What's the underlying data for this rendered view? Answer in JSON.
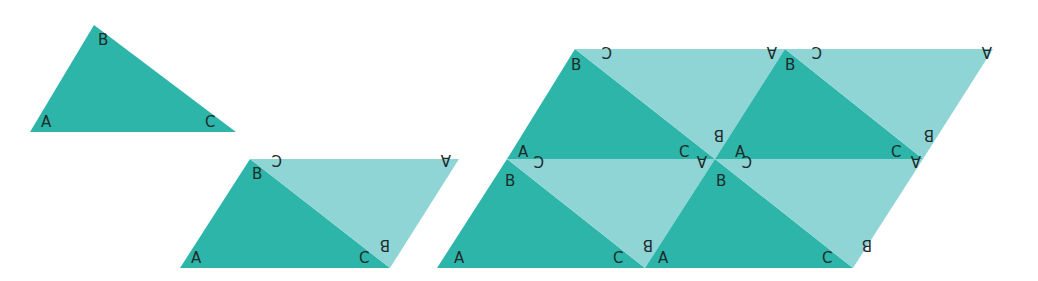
{
  "colors": {
    "dark": "#2db5a9",
    "light": "#8fd5d6",
    "label": "#1d2b2b",
    "background": "#ffffff"
  },
  "figures": [
    {
      "name": "single-triangle",
      "triangles": [
        {
          "shade": "dark",
          "pts": [
            [
              30,
              132
            ],
            [
              94,
              25
            ],
            [
              236,
              132
            ]
          ],
          "labels": [
            {
              "t": "A",
              "x": 41,
              "y": 127,
              "rot": 0
            },
            {
              "t": "B",
              "x": 98,
              "y": 45,
              "rot": 0
            },
            {
              "t": "C",
              "x": 205,
              "y": 127,
              "rot": 0
            }
          ]
        }
      ]
    },
    {
      "name": "parallelogram-two-triangles",
      "triangles": [
        {
          "shade": "dark",
          "pts": [
            [
              180,
              268
            ],
            [
              250,
              159
            ],
            [
              390,
              268
            ]
          ],
          "labels": [
            {
              "t": "A",
              "x": 191,
              "y": 263,
              "rot": 0
            },
            {
              "t": "B",
              "x": 252,
              "y": 179,
              "rot": 0
            },
            {
              "t": "C",
              "x": 359,
              "y": 263,
              "rot": 0
            }
          ]
        },
        {
          "shade": "light",
          "pts": [
            [
              250,
              159
            ],
            [
              459,
              159
            ],
            [
              390,
              268
            ]
          ],
          "labels": [
            {
              "t": "C",
              "x": 272,
              "y": 165,
              "rot": 180
            },
            {
              "t": "A",
              "x": 441,
              "y": 165,
              "rot": 180
            },
            {
              "t": "B",
              "x": 380,
              "y": 250,
              "rot": 180
            }
          ]
        }
      ]
    },
    {
      "name": "parallelogram-eight-triangles",
      "triangles": [
        {
          "shade": "dark",
          "pts": [
            [
              437,
              268
            ],
            [
              507,
              159
            ],
            [
              645,
              268
            ]
          ],
          "labels": [
            {
              "t": "A",
              "x": 454,
              "y": 263,
              "rot": 0
            },
            {
              "t": "B",
              "x": 505,
              "y": 186,
              "rot": 0
            },
            {
              "t": "C",
              "x": 613,
              "y": 263,
              "rot": 0
            }
          ]
        },
        {
          "shade": "light",
          "pts": [
            [
              507,
              159
            ],
            [
              715,
              159
            ],
            [
              645,
              268
            ]
          ],
          "labels": [
            {
              "t": "C",
              "x": 534,
              "y": 166,
              "rot": 180
            },
            {
              "t": "A",
              "x": 697,
              "y": 166,
              "rot": 180
            },
            {
              "t": "B",
              "x": 643,
              "y": 250,
              "rot": 180
            }
          ]
        },
        {
          "shade": "dark",
          "pts": [
            [
              645,
              268
            ],
            [
              715,
              159
            ],
            [
              853,
              268
            ]
          ],
          "labels": [
            {
              "t": "A",
              "x": 658,
              "y": 263,
              "rot": 0
            },
            {
              "t": "B",
              "x": 716,
              "y": 186,
              "rot": 0
            },
            {
              "t": "C",
              "x": 822,
              "y": 263,
              "rot": 0
            }
          ]
        },
        {
          "shade": "light",
          "pts": [
            [
              715,
              159
            ],
            [
              923,
              159
            ],
            [
              853,
              268
            ]
          ],
          "labels": [
            {
              "t": "C",
              "x": 742,
              "y": 166,
              "rot": 180
            },
            {
              "t": "A",
              "x": 911,
              "y": 166,
              "rot": 180
            },
            {
              "t": "B",
              "x": 862,
              "y": 250,
              "rot": 180
            }
          ]
        },
        {
          "shade": "dark",
          "pts": [
            [
              507,
              159
            ],
            [
              575,
              49
            ],
            [
              715,
              159
            ]
          ],
          "labels": [
            {
              "t": "A",
              "x": 518,
              "y": 157,
              "rot": 0
            },
            {
              "t": "B",
              "x": 571,
              "y": 70,
              "rot": 0
            },
            {
              "t": "C",
              "x": 679,
              "y": 157,
              "rot": 0
            }
          ]
        },
        {
          "shade": "light",
          "pts": [
            [
              575,
              49
            ],
            [
              785,
              49
            ],
            [
              715,
              159
            ]
          ],
          "labels": [
            {
              "t": "C",
              "x": 602,
              "y": 57,
              "rot": 180
            },
            {
              "t": "A",
              "x": 767,
              "y": 57,
              "rot": 180
            },
            {
              "t": "B",
              "x": 714,
              "y": 140,
              "rot": 180
            }
          ]
        },
        {
          "shade": "dark",
          "pts": [
            [
              715,
              159
            ],
            [
              785,
              49
            ],
            [
              923,
              159
            ]
          ],
          "labels": [
            {
              "t": "A",
              "x": 735,
              "y": 157,
              "rot": 0
            },
            {
              "t": "B",
              "x": 785,
              "y": 70,
              "rot": 0
            },
            {
              "t": "C",
              "x": 891,
              "y": 157,
              "rot": 0
            }
          ]
        },
        {
          "shade": "light",
          "pts": [
            [
              785,
              49
            ],
            [
              993,
              49
            ],
            [
              923,
              159
            ]
          ],
          "labels": [
            {
              "t": "C",
              "x": 812,
              "y": 57,
              "rot": 180
            },
            {
              "t": "A",
              "x": 982,
              "y": 57,
              "rot": 180
            },
            {
              "t": "B",
              "x": 924,
              "y": 140,
              "rot": 180
            }
          ]
        }
      ]
    }
  ]
}
